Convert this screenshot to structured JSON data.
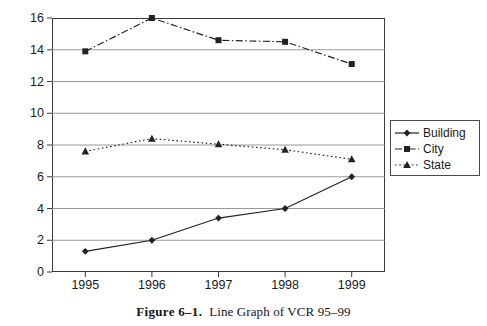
{
  "figure": {
    "caption_number": "Figure 6–1.",
    "caption_text": "Line Graph of VCR 95–99"
  },
  "legend": {
    "position": "right",
    "items": [
      {
        "label": "Building",
        "style": "solid",
        "marker": "diamond",
        "color": "#222222"
      },
      {
        "label": "City",
        "style": "dash-dot",
        "marker": "square",
        "color": "#222222"
      },
      {
        "label": "State",
        "style": "dotted",
        "marker": "triangle",
        "color": "#222222"
      }
    ]
  },
  "axes": {
    "y_ticks": [
      "0",
      "2",
      "4",
      "6",
      "8",
      "10",
      "12",
      "14",
      "16"
    ],
    "x_ticks": [
      "1995",
      "1996",
      "1997",
      "1998",
      "1999"
    ]
  },
  "chart_data": {
    "type": "line",
    "title": "",
    "xlabel": "",
    "ylabel": "",
    "categories": [
      "1995",
      "1996",
      "1997",
      "1998",
      "1999"
    ],
    "series": [
      {
        "name": "Building",
        "values": [
          1.3,
          2.0,
          3.4,
          4.0,
          6.0
        ],
        "marker": "diamond",
        "line": "solid"
      },
      {
        "name": "City",
        "values": [
          13.9,
          16.0,
          14.6,
          14.5,
          13.1
        ],
        "marker": "square",
        "line": "dash-dot"
      },
      {
        "name": "State",
        "values": [
          7.6,
          8.4,
          8.05,
          7.7,
          7.1
        ],
        "marker": "triangle",
        "line": "dotted"
      }
    ],
    "ylim": [
      0,
      16
    ],
    "ytick_step": 2,
    "grid": true,
    "grid_axis": "y",
    "legend": "right"
  },
  "colors": {
    "ink": "#222222",
    "frame": "#3a3a3a",
    "grid": "#8d8d8d",
    "background": "#ffffff"
  }
}
